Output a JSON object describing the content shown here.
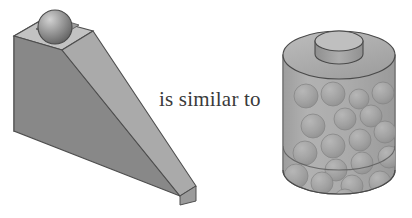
{
  "figure": {
    "background_color": "#ffffff",
    "caption": {
      "text": "is similar to",
      "color": "#3a3a3a"
    },
    "left_object": {
      "name": "inclined-wedge-with-ball",
      "description": "Grey 3D wedge (inclined plane / ramp) with a sphere resting in a square recess at its high end",
      "colors": {
        "front_face": "#8a8a8a",
        "left_face": "#777777",
        "ramp_face": "#a6a6a6",
        "top_face": "#bdbdbd",
        "recess_face": "#9b9b9b",
        "outline": "#4a4a4a",
        "ball_light": "#c9c9c9",
        "ball_mid": "#9a9a9a",
        "ball_dark": "#6b6b6b"
      },
      "ball_count": 1
    },
    "right_object": {
      "name": "cylinder-of-gas-with-particles",
      "description": "Translucent grey cylinder containing many spheres (gas particles), capped by a smaller cylindrical piston on top",
      "colors": {
        "body": "#a3a3a3",
        "body_light": "#b8b8b8",
        "top_ellipse": "#b0b0b0",
        "piston_top": "#bcbcbc",
        "piston_side": "#9a9a9a",
        "sphere_light": "#b4b4b4",
        "sphere_dark": "#7e7e7e",
        "outline": "#4a4a4a"
      },
      "particle_count": 19,
      "particles": [
        {
          "cx": 306,
          "cy": 96,
          "r": 12
        },
        {
          "cx": 333,
          "cy": 94,
          "r": 12
        },
        {
          "cx": 359,
          "cy": 99,
          "r": 10
        },
        {
          "cx": 383,
          "cy": 93,
          "r": 11
        },
        {
          "cx": 371,
          "cy": 116,
          "r": 11
        },
        {
          "cx": 345,
          "cy": 119,
          "r": 11
        },
        {
          "cx": 313,
          "cy": 126,
          "r": 12
        },
        {
          "cx": 333,
          "cy": 146,
          "r": 12
        },
        {
          "cx": 360,
          "cy": 140,
          "r": 11
        },
        {
          "cx": 385,
          "cy": 132,
          "r": 11
        },
        {
          "cx": 389,
          "cy": 157,
          "r": 11
        },
        {
          "cx": 362,
          "cy": 163,
          "r": 11
        },
        {
          "cx": 336,
          "cy": 170,
          "r": 11
        },
        {
          "cx": 305,
          "cy": 153,
          "r": 12
        },
        {
          "cx": 296,
          "cy": 176,
          "r": 12
        },
        {
          "cx": 322,
          "cy": 183,
          "r": 11
        },
        {
          "cx": 352,
          "cy": 186,
          "r": 11
        },
        {
          "cx": 380,
          "cy": 182,
          "r": 11
        },
        {
          "cx": 345,
          "cy": 200,
          "r": 11
        }
      ]
    }
  }
}
